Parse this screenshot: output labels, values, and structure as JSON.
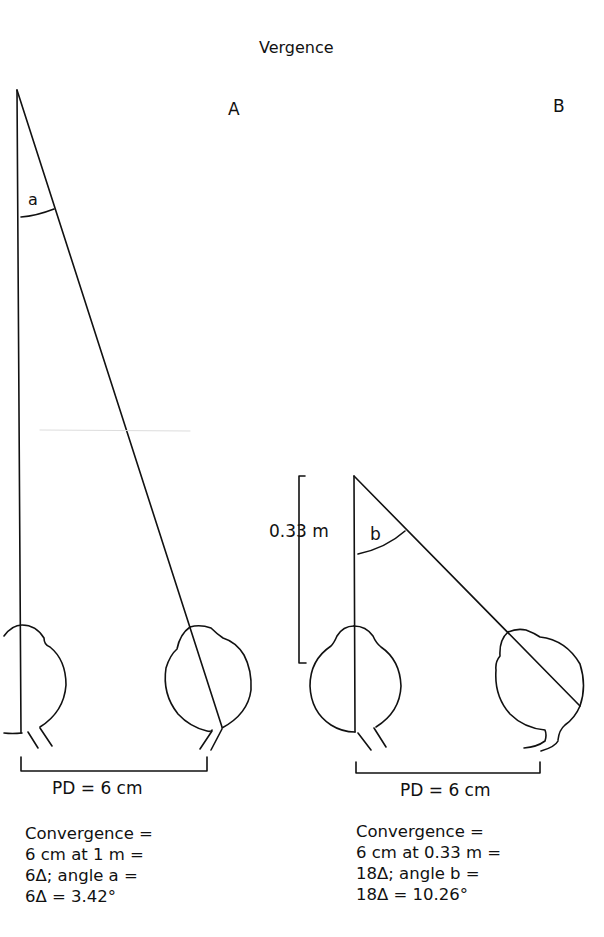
{
  "title": "Vergence",
  "panels": {
    "a": {
      "letter": "A",
      "angle_label": "a",
      "pd_label": "PD = 6 cm",
      "caption": [
        "Convergence =",
        "6 cm at 1 m =",
        "6Δ; angle a =",
        "6Δ = 3.42°"
      ]
    },
    "b": {
      "letter": "B",
      "angle_label": "b",
      "distance_label": "0.33 m",
      "pd_label": "PD = 6 cm",
      "caption": [
        "Convergence =",
        "6 cm at 0.33 m =",
        "18Δ; angle b =",
        "18Δ = 10.26°"
      ]
    }
  },
  "colors": {
    "line": "#111111",
    "background": "#ffffff"
  }
}
